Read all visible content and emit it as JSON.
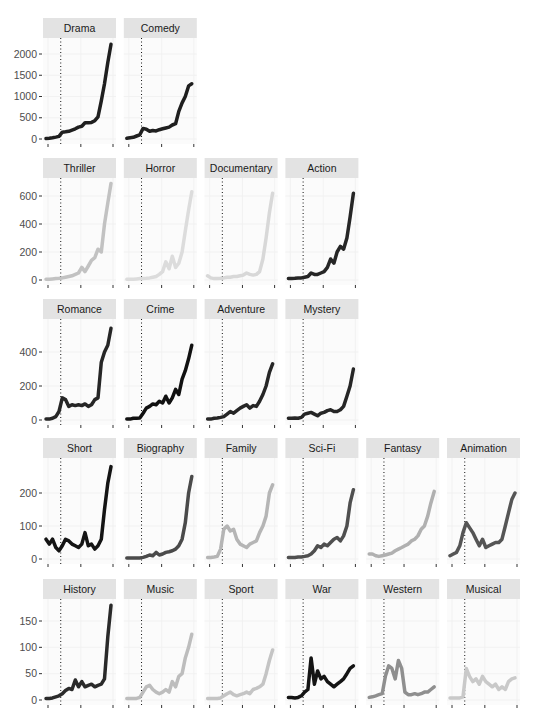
{
  "chart_data": {
    "type": "line",
    "title": "",
    "xlabel": "",
    "ylabel": "",
    "layout": {
      "facet": "wrap",
      "scales": "free_y per row",
      "grid": true,
      "legend": "none",
      "x_tick_labels": "none",
      "reference_line": "vertical dotted line at ~22% of x range"
    },
    "x_ticks_relative": [
      0.03,
      0.52,
      1.0
    ],
    "vline_relative": 0.22,
    "rows": [
      {
        "ylim": [
          0,
          2300
        ],
        "y_ticks": [
          0,
          500,
          1000,
          1500,
          2000
        ],
        "panels": [
          {
            "name": "Drama",
            "color": "#1f1f1f",
            "values": [
              10,
              20,
              30,
              45,
              60,
              160,
              170,
              180,
              210,
              240,
              280,
              300,
              380,
              380,
              390,
              430,
              520,
              900,
              1300,
              1800,
              2230
            ]
          },
          {
            "name": "Comedy",
            "color": "#1f1f1f",
            "values": [
              20,
              30,
              40,
              70,
              100,
              250,
              230,
              180,
              200,
              190,
              220,
              240,
              260,
              280,
              330,
              360,
              650,
              850,
              1000,
              1250,
              1300
            ]
          }
        ]
      },
      {
        "ylim": [
          0,
          700
        ],
        "y_ticks": [
          0,
          200,
          400,
          600
        ],
        "panels": [
          {
            "name": "Thriller",
            "color": "#c2c2c2",
            "values": [
              5,
              5,
              8,
              10,
              12,
              15,
              20,
              25,
              30,
              40,
              50,
              90,
              60,
              100,
              140,
              160,
              220,
              200,
              400,
              550,
              690
            ]
          },
          {
            "name": "Horror",
            "color": "#dcdcdc",
            "values": [
              5,
              5,
              5,
              8,
              10,
              10,
              12,
              15,
              20,
              25,
              40,
              60,
              130,
              80,
              170,
              90,
              120,
              200,
              350,
              500,
              630
            ]
          },
          {
            "name": "Documentary",
            "color": "#d8d8d8",
            "values": [
              30,
              15,
              10,
              10,
              12,
              15,
              20,
              20,
              25,
              25,
              30,
              35,
              50,
              40,
              35,
              40,
              60,
              150,
              300,
              480,
              620
            ]
          },
          {
            "name": "Action",
            "color": "#262626",
            "values": [
              10,
              10,
              12,
              15,
              15,
              20,
              25,
              50,
              40,
              40,
              50,
              60,
              90,
              150,
              120,
              200,
              240,
              220,
              300,
              450,
              620
            ]
          }
        ]
      },
      {
        "ylim": [
          0,
          560
        ],
        "y_ticks": [
          0,
          200,
          400
        ],
        "panels": [
          {
            "name": "Romance",
            "color": "#262626",
            "values": [
              5,
              5,
              10,
              20,
              50,
              130,
              120,
              80,
              90,
              85,
              90,
              85,
              95,
              80,
              90,
              120,
              130,
              340,
              400,
              440,
              540
            ]
          },
          {
            "name": "Crime",
            "color": "#111111",
            "values": [
              5,
              5,
              10,
              10,
              12,
              40,
              70,
              80,
              95,
              90,
              110,
              100,
              140,
              100,
              130,
              180,
              150,
              240,
              290,
              360,
              440
            ]
          },
          {
            "name": "Adventure",
            "color": "#262626",
            "values": [
              5,
              5,
              10,
              12,
              15,
              20,
              35,
              50,
              40,
              55,
              70,
              80,
              90,
              70,
              85,
              80,
              110,
              150,
              200,
              280,
              330
            ]
          },
          {
            "name": "Mystery",
            "color": "#262626",
            "values": [
              10,
              10,
              12,
              10,
              15,
              35,
              40,
              45,
              35,
              25,
              40,
              45,
              55,
              60,
              50,
              50,
              60,
              80,
              140,
              200,
              300
            ]
          }
        ]
      },
      {
        "ylim": [
          0,
          290
        ],
        "y_ticks": [
          0,
          100,
          200
        ],
        "panels": [
          {
            "name": "Short",
            "color": "#141414",
            "values": [
              60,
              45,
              60,
              35,
              25,
              40,
              60,
              55,
              45,
              40,
              35,
              45,
              80,
              40,
              45,
              30,
              40,
              60,
              150,
              230,
              280
            ]
          },
          {
            "name": "Biography",
            "color": "#4a4a4a",
            "values": [
              3,
              3,
              3,
              3,
              3,
              5,
              8,
              12,
              10,
              20,
              12,
              15,
              20,
              22,
              25,
              30,
              40,
              60,
              110,
              200,
              250
            ]
          },
          {
            "name": "Family",
            "color": "#b5b5b5",
            "values": [
              5,
              5,
              6,
              8,
              30,
              90,
              100,
              85,
              90,
              60,
              45,
              40,
              35,
              45,
              50,
              55,
              80,
              100,
              130,
              200,
              225
            ]
          },
          {
            "name": "Sci-Fi",
            "color": "#4f4f4f",
            "values": [
              5,
              5,
              5,
              6,
              6,
              8,
              10,
              15,
              25,
              40,
              35,
              45,
              40,
              50,
              60,
              65,
              55,
              70,
              100,
              170,
              210
            ]
          },
          {
            "name": "Fantasy",
            "color": "#b0b0b0",
            "values": [
              15,
              15,
              10,
              8,
              10,
              12,
              15,
              18,
              25,
              30,
              35,
              40,
              45,
              55,
              60,
              70,
              90,
              100,
              130,
              170,
              205
            ]
          },
          {
            "name": "Animation",
            "color": "#555555",
            "values": [
              10,
              15,
              20,
              40,
              80,
              110,
              95,
              80,
              60,
              40,
              60,
              35,
              40,
              45,
              50,
              50,
              60,
              100,
              140,
              180,
              200
            ]
          }
        ]
      },
      {
        "ylim": [
          0,
          185
        ],
        "y_ticks": [
          0,
          50,
          100,
          150
        ],
        "panels": [
          {
            "name": "History",
            "color": "#2a2a2a",
            "values": [
              3,
              3,
              4,
              6,
              8,
              12,
              18,
              22,
              20,
              38,
              25,
              35,
              25,
              28,
              30,
              25,
              28,
              30,
              40,
              120,
              180
            ]
          },
          {
            "name": "Music",
            "color": "#bdbdbd",
            "values": [
              3,
              3,
              3,
              3,
              5,
              15,
              25,
              28,
              20,
              15,
              12,
              15,
              20,
              15,
              35,
              25,
              45,
              50,
              80,
              100,
              125
            ]
          },
          {
            "name": "Sport",
            "color": "#c4c4c4",
            "values": [
              3,
              3,
              3,
              3,
              4,
              8,
              12,
              15,
              10,
              8,
              10,
              12,
              15,
              12,
              20,
              22,
              25,
              30,
              50,
              75,
              95
            ]
          },
          {
            "name": "War",
            "color": "#141414",
            "values": [
              5,
              5,
              4,
              5,
              8,
              15,
              20,
              80,
              30,
              55,
              40,
              45,
              35,
              30,
              25,
              30,
              35,
              40,
              50,
              60,
              65
            ]
          },
          {
            "name": "Western",
            "color": "#8f8f8f",
            "values": [
              5,
              6,
              8,
              10,
              12,
              45,
              65,
              60,
              40,
              75,
              60,
              15,
              10,
              10,
              12,
              10,
              12,
              15,
              15,
              20,
              25
            ]
          },
          {
            "name": "Musical",
            "color": "#c9c9c9",
            "values": [
              4,
              4,
              4,
              4,
              6,
              60,
              45,
              35,
              40,
              30,
              45,
              35,
              30,
              25,
              30,
              20,
              25,
              20,
              35,
              40,
              42
            ]
          }
        ]
      }
    ]
  }
}
